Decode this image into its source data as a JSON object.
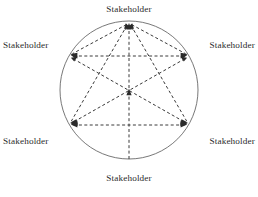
{
  "diagram": {
    "type": "stakeholder-network",
    "title": "",
    "geometry": {
      "circle_center_x": 129,
      "circle_center_y": 90,
      "circle_radius": 69,
      "circle_stroke_color": "#555555",
      "circle_stroke_width": 0.8,
      "edge_stroke_color": "#3a3a3a",
      "edge_stroke_width": 1.0,
      "edge_dash_pattern": "3,2.4",
      "arrowhead_color": "#2b2b2b",
      "label_color": "#2b2b2b"
    },
    "nodes": [
      {
        "id": "top",
        "label": "Stakeholder",
        "angle_deg": 90,
        "x": 129,
        "y": 21,
        "label_position": "above"
      },
      {
        "id": "upper-right",
        "label": "Stakeholder",
        "angle_deg": 30,
        "x": 189,
        "y": 56,
        "label_position": "right"
      },
      {
        "id": "lower-right",
        "label": "Stakeholder",
        "angle_deg": 330,
        "x": 189,
        "y": 125,
        "label_position": "right"
      },
      {
        "id": "bottom",
        "label": "Stakeholder",
        "angle_deg": 270,
        "x": 129,
        "y": 159,
        "label_position": "below"
      },
      {
        "id": "lower-left",
        "label": "Stakeholder",
        "angle_deg": 210,
        "x": 69,
        "y": 125,
        "label_position": "left"
      },
      {
        "id": "upper-left",
        "label": "Stakeholder",
        "angle_deg": 150,
        "x": 69,
        "y": 56,
        "label_position": "left"
      }
    ],
    "edges": [
      {
        "from": "upper-left",
        "to": "upper-right",
        "arrows": "both",
        "style": "dashed"
      },
      {
        "from": "lower-left",
        "to": "lower-right",
        "arrows": "both",
        "style": "dashed"
      },
      {
        "from": "upper-left",
        "to": "lower-right",
        "arrows": "both",
        "style": "dashed"
      },
      {
        "from": "upper-right",
        "to": "lower-left",
        "arrows": "both",
        "style": "dashed"
      },
      {
        "from": "top",
        "to": "lower-left",
        "arrows": "both",
        "style": "dashed"
      },
      {
        "from": "top",
        "to": "lower-right",
        "arrows": "both",
        "style": "dashed"
      },
      {
        "from": "top",
        "to": "upper-left",
        "arrows": "both",
        "style": "dashed"
      },
      {
        "from": "top",
        "to": "upper-right",
        "arrows": "both",
        "style": "dashed"
      },
      {
        "from": "bottom",
        "to": "top",
        "arrows": "center-and-end",
        "style": "dashed"
      }
    ]
  }
}
